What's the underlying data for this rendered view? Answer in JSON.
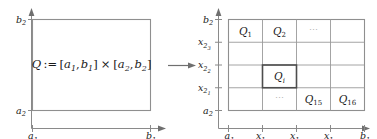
{
  "figure": {
    "colors": {
      "text": "#1a1a1a",
      "axis": "#8a8a8a",
      "box": "#8f8f8f",
      "grid": "#9a9a9a",
      "highlight": "#4d4d4d",
      "ellipsis": "#b4b4b4",
      "background": "#ffffff"
    }
  },
  "left_panel": {
    "name": "domain-rectangle-panel",
    "formula": {
      "Q": "Q",
      "assign": ":=",
      "lhs_open": "[",
      "a1": "a",
      "a1_sub": "1",
      "comma1": ",",
      "b1": "b",
      "b1_sub": "1",
      "lhs_close": "]",
      "times": "×",
      "rhs_open": "[",
      "a2": "a",
      "a2_sub": "2",
      "comma2": ",",
      "b2": "b",
      "b2_sub": "2",
      "rhs_close": "]"
    },
    "y_axis": {
      "ticks": [
        {
          "base": "b",
          "sub": "2"
        },
        {
          "base": "a",
          "sub": "2"
        }
      ]
    },
    "x_axis": {
      "ticks": [
        {
          "base": "a",
          "sub": "1"
        },
        {
          "base": "b",
          "sub": "1"
        }
      ]
    }
  },
  "map_arrow": {
    "name": "transform-arrow",
    "glyph": "→"
  },
  "right_panel": {
    "name": "partitioned-grid-panel",
    "y_axis": {
      "ticks": [
        {
          "base": "b",
          "sub": "2"
        },
        {
          "base": "x",
          "sub": "2",
          "subsub": "3"
        },
        {
          "base": "x",
          "sub": "2",
          "subsub": "2"
        },
        {
          "base": "x",
          "sub": "2",
          "subsub": "1"
        },
        {
          "base": "a",
          "sub": "2"
        }
      ]
    },
    "x_axis": {
      "ticks": [
        {
          "base": "a",
          "sub": "1"
        },
        {
          "base": "x",
          "sub": "1",
          "subsub": "1"
        },
        {
          "base": "x",
          "sub": "1",
          "subsub": "2"
        },
        {
          "base": "x",
          "sub": "1",
          "subsub": "3"
        },
        {
          "base": "b",
          "sub": "1"
        }
      ]
    },
    "grid": {
      "rows": 4,
      "cols": 4
    },
    "cell_labels": [
      {
        "name": "cell-Q1",
        "row": 0,
        "col": 0,
        "base": "Q",
        "sub": "1"
      },
      {
        "name": "cell-Q2",
        "row": 0,
        "col": 1,
        "base": "Q",
        "sub": "2"
      },
      {
        "name": "cell-Qi",
        "row": 2,
        "col": 1,
        "base": "Q",
        "sub": "i",
        "italic_sub": true,
        "highlighted": true
      },
      {
        "name": "cell-Q15",
        "row": 3,
        "col": 2,
        "base": "Q",
        "sub": "15"
      },
      {
        "name": "cell-Q16",
        "row": 3,
        "col": 3,
        "base": "Q",
        "sub": "16"
      }
    ],
    "ellipses": [
      {
        "name": "ellipsis-top-row",
        "row": 0,
        "col": 2,
        "glyph": "⋯"
      },
      {
        "name": "ellipsis-bottom-row",
        "row": 3,
        "col": 1,
        "glyph": "⋯"
      }
    ]
  }
}
